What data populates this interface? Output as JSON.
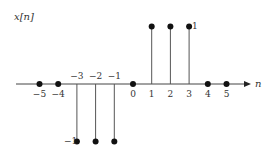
{
  "chart_data": {
    "type": "stem",
    "title": "x[n]",
    "xlabel": "n",
    "ylabel": "x[n]",
    "x": [
      -5,
      -4,
      -3,
      -2,
      -1,
      0,
      1,
      2,
      3,
      4,
      5
    ],
    "values": [
      0,
      0,
      -1,
      -1,
      -1,
      0,
      1,
      1,
      1,
      0,
      0
    ],
    "xtick_labels": [
      "−5",
      "−4",
      "−3",
      "−2",
      "−1",
      "0",
      "1",
      "2",
      "3",
      "4",
      "5"
    ],
    "ytick_labels": [
      "1",
      "−1"
    ],
    "xlim": [
      -6,
      6
    ],
    "ylim": [
      -1,
      1
    ],
    "grid": false,
    "legend": null
  },
  "labels": {
    "y_axis_title": "x[n]",
    "x_axis_title": "n",
    "y_pos": "1",
    "y_neg": "−1"
  }
}
